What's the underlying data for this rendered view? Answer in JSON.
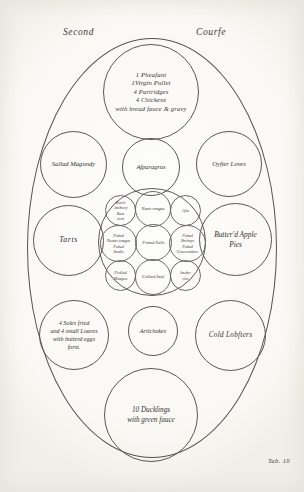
{
  "page": {
    "heading_left": "Second",
    "heading_right": "Courfe",
    "plate_caption": "Tab. 10"
  },
  "table": {
    "shape": "oval",
    "dishes": [
      {
        "id": "pheasant",
        "name": "roast-fowl-dish",
        "position": "top-centre",
        "label": "1 Pheafant\n1Virgin Pullet\n4 Partridges\n4 Chickens\nwith bread fauce & gravy"
      },
      {
        "id": "salad",
        "name": "sallad-magundy-dish",
        "position": "upper-left",
        "label": "Sallad Magundy"
      },
      {
        "id": "asparagus",
        "name": "asparagus-dish",
        "position": "upper-centre",
        "label": "Afparagrus"
      },
      {
        "id": "oyster",
        "name": "oyster-loaves-dish",
        "position": "upper-right",
        "label": "Oyfter Loves"
      },
      {
        "id": "tarts",
        "name": "tarts-dish",
        "position": "middle-left",
        "label": "Tarts"
      },
      {
        "id": "applepies",
        "name": "butterd-apple-pies-dish",
        "position": "middle-right",
        "label": "Butter'd Apple\nPies"
      },
      {
        "id": "soles",
        "name": "soles-and-loaves-dish",
        "position": "lower-left",
        "label": "4 Soles fried\nand 4 small Loaves\nwith butterd eggs\nforst."
      },
      {
        "id": "artichokes",
        "name": "artichokes-dish",
        "position": "lower-centre",
        "label": "Artichokes"
      },
      {
        "id": "lobsters",
        "name": "cold-lobsters-dish",
        "position": "lower-right",
        "label": "Cold Lobfters"
      },
      {
        "id": "ducklings",
        "name": "ducklings-dish",
        "position": "bottom-centre",
        "label": "10 Ducklings\nwith green fauce"
      }
    ],
    "centre_cluster": {
      "name": "centre-potted-meats-cluster",
      "small_dishes": [
        {
          "id": "rowls",
          "position": "top-left",
          "label": "Rowls\nAnchovy\nBeet\nroot"
        },
        {
          "id": "neats",
          "position": "top-centre",
          "label": "Neats tongue"
        },
        {
          "id": "asia",
          "position": "top-right",
          "label": "Afia"
        },
        {
          "id": "potted-tongue",
          "position": "middle-left",
          "label": "Potted\nNeates tongue\nPotted\nSmelts"
        },
        {
          "id": "potted-eells",
          "position": "centre",
          "label": "Potted Eells"
        },
        {
          "id": "potted-shrimps",
          "position": "middle-right",
          "label": "Potted\nShrimps\nPotted\nCowcombers"
        },
        {
          "id": "mangoe",
          "position": "bottom-left",
          "label": "Pickled\nMangoe"
        },
        {
          "id": "collard",
          "position": "bottom-centre",
          "label": "Collard beef"
        },
        {
          "id": "anchovies",
          "position": "bottom-right",
          "label": "Ancho-\nvies"
        }
      ]
    }
  },
  "colors": {
    "ink": "#55534e",
    "paper": "#fdfdfb",
    "text": "#333230"
  }
}
